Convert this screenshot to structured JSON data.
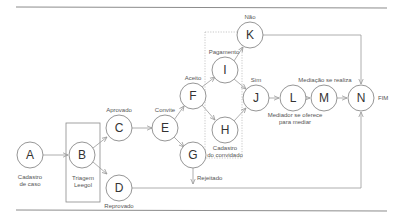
{
  "diagram": {
    "type": "flowchart",
    "nodes": [
      {
        "id": "A",
        "label": "A",
        "caption": [
          "Cadastro",
          "de caso"
        ]
      },
      {
        "id": "B",
        "label": "B",
        "caption": [
          "Triagem",
          "Leegol"
        ]
      },
      {
        "id": "C",
        "label": "C",
        "caption": [
          "Aprovado"
        ]
      },
      {
        "id": "D",
        "label": "D",
        "caption": [
          "Reprovado"
        ]
      },
      {
        "id": "E",
        "label": "E",
        "caption": [
          "Convite"
        ]
      },
      {
        "id": "F",
        "label": "F",
        "caption": [
          "Aceito"
        ]
      },
      {
        "id": "G",
        "label": "G",
        "caption": []
      },
      {
        "id": "H",
        "label": "H",
        "caption": [
          "Cadastro",
          "do convidado"
        ]
      },
      {
        "id": "I",
        "label": "I",
        "caption": [
          "Pagamento"
        ]
      },
      {
        "id": "J",
        "label": "J",
        "caption": [
          "Sim"
        ]
      },
      {
        "id": "K",
        "label": "K",
        "caption": [
          "Não"
        ]
      },
      {
        "id": "L",
        "label": "L",
        "caption": [
          "Mediador se oferece",
          "para mediar"
        ]
      },
      {
        "id": "M",
        "label": "M",
        "caption": [
          "Mediação se realiza"
        ]
      },
      {
        "id": "N",
        "label": "N",
        "caption": [
          "FIM"
        ]
      }
    ],
    "edges": [
      {
        "from": "A",
        "to": "B"
      },
      {
        "from": "B",
        "to": "C"
      },
      {
        "from": "B",
        "to": "D"
      },
      {
        "from": "C",
        "to": "E"
      },
      {
        "from": "E",
        "to": "F"
      },
      {
        "from": "E",
        "to": "G"
      },
      {
        "from": "F",
        "to": "I"
      },
      {
        "from": "F",
        "to": "H"
      },
      {
        "from": "I",
        "to": "K"
      },
      {
        "from": "I",
        "to": "J"
      },
      {
        "from": "H",
        "to": "J"
      },
      {
        "from": "J",
        "to": "L"
      },
      {
        "from": "L",
        "to": "M"
      },
      {
        "from": "M",
        "to": "N"
      },
      {
        "from": "K",
        "to": "N"
      },
      {
        "from": "D",
        "to": "N"
      },
      {
        "from": "G",
        "to": "down",
        "label": "Rejeitado"
      }
    ],
    "labels": {
      "rejeitado": "Rejeitado"
    }
  }
}
